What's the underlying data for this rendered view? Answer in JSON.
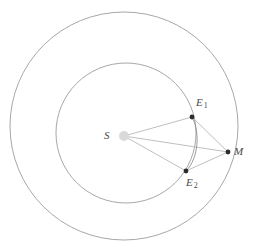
{
  "diagram": {
    "background_color": "#ffffff",
    "stroke_color": "#9a9a9a",
    "line_color": "#b4b4b4",
    "point_color": "#2b2b2b",
    "sun_color": "#d9d9d9",
    "label_color": "#4a4a4a",
    "width": 253,
    "height": 248
  },
  "orbits": [
    {
      "name": "outer-orbit",
      "label": "Mars orbit",
      "cx": 124,
      "cy": 126,
      "r": 114,
      "stroke": "#9d9d9d",
      "stroke_width": 0.9
    },
    {
      "name": "inner-orbit",
      "label": "Earth orbit",
      "cx": 126,
      "cy": 133,
      "r": 70,
      "stroke": "#9d9d9d",
      "stroke_width": 0.9
    }
  ],
  "points": [
    {
      "id": "S",
      "label": "S",
      "subscript": "",
      "cx": 124,
      "cy": 136,
      "r": 5,
      "fill": "#d9d9d9",
      "kind": "sun"
    },
    {
      "id": "E1",
      "label": "E",
      "subscript": "1",
      "cx": 192,
      "cy": 117,
      "r": 2.4,
      "fill": "#2b2b2b",
      "kind": "body"
    },
    {
      "id": "E2",
      "label": "E",
      "subscript": "2",
      "cx": 186,
      "cy": 171,
      "r": 2.4,
      "fill": "#2b2b2b",
      "kind": "body"
    },
    {
      "id": "M",
      "label": "M",
      "subscript": "",
      "cx": 228,
      "cy": 152,
      "r": 2.4,
      "fill": "#2b2b2b",
      "kind": "body"
    }
  ],
  "segments": [
    {
      "name": "line-S-E1",
      "from": "S",
      "to": "E1",
      "x1": 124,
      "y1": 136,
      "x2": 192,
      "y2": 117
    },
    {
      "name": "line-S-E2",
      "from": "S",
      "to": "E2",
      "x1": 124,
      "y1": 136,
      "x2": 186,
      "y2": 171
    },
    {
      "name": "line-S-M",
      "from": "S",
      "to": "M",
      "x1": 124,
      "y1": 136,
      "x2": 228,
      "y2": 152
    },
    {
      "name": "line-E1-M",
      "from": "E1",
      "to": "M",
      "x1": 192,
      "y1": 117,
      "x2": 228,
      "y2": 152
    },
    {
      "name": "line-E2-M",
      "from": "E2",
      "to": "M",
      "x1": 186,
      "y1": 171,
      "x2": 228,
      "y2": 152
    }
  ],
  "arcs": [
    {
      "name": "arc-E1-E2",
      "d": "M 192 117 C 200 131, 199 158, 186 171",
      "stroke": "#8f8f8f",
      "stroke_width": 0.9
    }
  ]
}
